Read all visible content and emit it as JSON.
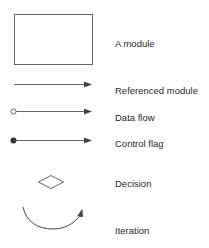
{
  "legend": {
    "items": [
      {
        "symbol": "rectangle",
        "label": "A module"
      },
      {
        "symbol": "arrow-line",
        "label": "Referenced module"
      },
      {
        "symbol": "open-circle-arrow",
        "label": "Data flow"
      },
      {
        "symbol": "filled-circle-arrow",
        "label": "Control flag"
      },
      {
        "symbol": "diamond",
        "label": "Decision"
      },
      {
        "symbol": "curved-arrow",
        "label": "Iteration"
      }
    ]
  },
  "colors": {
    "stroke": "#555555",
    "text": "#2a2a2a",
    "background": "#ffffff"
  }
}
